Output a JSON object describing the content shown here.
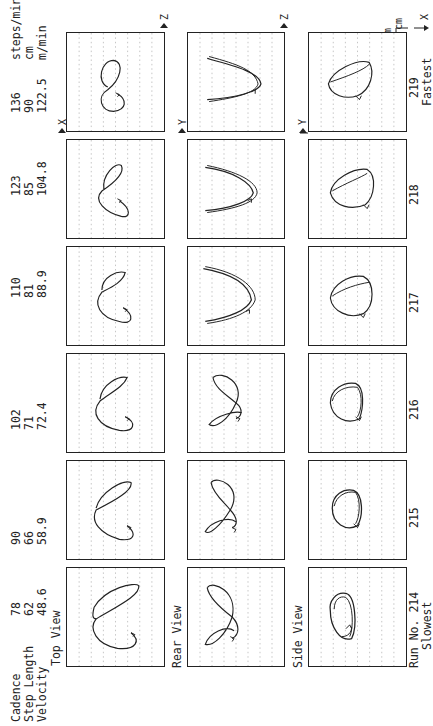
{
  "figure": {
    "orientation": "rotated 90deg counter-clockwise",
    "row_header_labels": {
      "cadence": "Cadence",
      "step_length": "Step Length",
      "velocity": "Velocity"
    },
    "units": {
      "cadence": "steps/min",
      "step_length": "cm",
      "velocity": "m/min"
    },
    "view_labels": {
      "top": "Top View",
      "rear": "Rear View",
      "side": "Side View"
    },
    "axis_labels": {
      "top_view_vertical": "X",
      "top_view_horizontal": "Z",
      "rear_view_vertical": "Y",
      "rear_view_horizontal": "Z",
      "side_view_vertical": "Y",
      "side_view_horizontal": "X"
    },
    "scale_labels": [
      "cm",
      "cm"
    ],
    "run_prefix": "Run No.",
    "slowest_label": "Slowest",
    "fastest_label": "Fastest",
    "runs": [
      {
        "run": "214",
        "cadence": "78",
        "step_length": "62",
        "velocity": "48.6"
      },
      {
        "run": "215",
        "cadence": "90",
        "step_length": "66",
        "velocity": "58.9"
      },
      {
        "run": "216",
        "cadence": "102",
        "step_length": "71",
        "velocity": "72.4"
      },
      {
        "run": "217",
        "cadence": "110",
        "step_length": "81",
        "velocity": "88.9"
      },
      {
        "run": "218",
        "cadence": "123",
        "step_length": "85",
        "velocity": "104.8"
      },
      {
        "run": "219",
        "cadence": "136",
        "step_length": "90",
        "velocity": "122.5"
      }
    ],
    "labels_display": {
      "r214_run": "Run No. 214",
      "r219_run": "219",
      "r218_run": "218",
      "r217_run": "217",
      "r216_run": "216",
      "r215_run": "215",
      "r214_vals": "78\n62\n48.6",
      "r215_vals": "90\n66\n58.9",
      "r216_vals": "102\n71\n72.4",
      "r217_vals": "110\n81\n88.9",
      "r218_vals": "123\n85\n104.8",
      "r219_vals": "136\n90\n122.5",
      "r219_units": "steps/min\ncm\nm/min",
      "header": "Cadence\nStep Length\nVelocity"
    }
  }
}
